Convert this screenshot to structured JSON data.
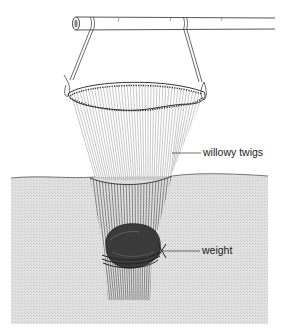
{
  "figure": {
    "labels": {
      "twigs": "willowy twigs",
      "weight": "weight"
    },
    "colors": {
      "background": "#ffffff",
      "water": "#dcdcdc",
      "water_surface": "#555555",
      "line": "#333333",
      "twig_above": "#9a9a9a",
      "twig_below": "#4a4a4a",
      "weight": "#3a3a3a"
    }
  }
}
